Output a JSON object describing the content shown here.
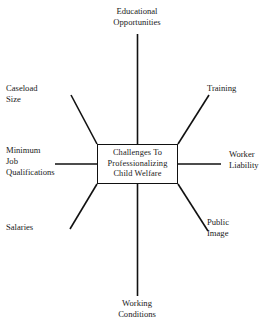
{
  "diagram": {
    "type": "radial-spider-diagram",
    "background_color": "#ffffff",
    "line_color": "#111111",
    "text_color": "#1a1a1a",
    "center": {
      "line1": "Challenges To",
      "line2": "Professionalizing",
      "line3": "Child Welfare"
    },
    "nodes": [
      {
        "id": "educational-opportunities",
        "line1": "Educational",
        "line2": "Opportunities",
        "position": "top"
      },
      {
        "id": "training",
        "line1": "Training",
        "line2": "",
        "position": "top-right"
      },
      {
        "id": "worker-liability",
        "line1": "Worker",
        "line2": "Liability",
        "position": "right"
      },
      {
        "id": "public-image",
        "line1": "Public",
        "line2": "Image",
        "position": "bottom-right"
      },
      {
        "id": "working-conditions",
        "line1": "Working",
        "line2": "Conditions",
        "position": "bottom"
      },
      {
        "id": "salaries",
        "line1": "Salaries",
        "line2": "",
        "position": "bottom-left"
      },
      {
        "id": "minimum-job-qualifications",
        "line1": "Minimum",
        "line2": "Job",
        "line3": "Qualifications",
        "position": "left"
      },
      {
        "id": "caseload-size",
        "line1": "Caseload",
        "line2": "Size",
        "position": "top-left"
      }
    ]
  }
}
